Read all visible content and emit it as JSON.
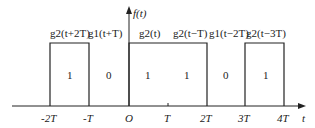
{
  "diagram": {
    "y_axis_label": "f(t)",
    "x_axis_label": "t",
    "ticks": [
      {
        "label": "-2T",
        "x": 50
      },
      {
        "label": "-T",
        "x": 89
      },
      {
        "label": "O",
        "x": 129
      },
      {
        "label": "T",
        "x": 168
      },
      {
        "label": "2T",
        "x": 207
      },
      {
        "label": "3T",
        "x": 245
      },
      {
        "label": "4T",
        "x": 284
      }
    ],
    "segments": [
      {
        "func": "g2(t+2T)",
        "value": "1"
      },
      {
        "func": "g1(t+T)",
        "value": "0"
      },
      {
        "func": "g2(t)",
        "value": "1"
      },
      {
        "func": "g2(t−T)",
        "value": "1"
      },
      {
        "func": "g1(t−2T)",
        "value": "0"
      },
      {
        "func": "g2(t−3T)",
        "value": "1"
      }
    ],
    "colors": {
      "line": "#222222",
      "background": "#ffffff"
    }
  }
}
